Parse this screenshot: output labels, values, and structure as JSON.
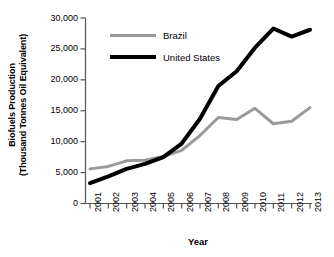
{
  "chart_data": {
    "type": "line",
    "title": "",
    "xlabel": "Year",
    "ylabel": "Biofuels Production (Thousand Tonnes Oil Equivalent)",
    "ylabel_line1": "Biofuels Production",
    "ylabel_line2": "(Thousand Tonnes Oil Equivalent)",
    "categories": [
      "2001",
      "2002",
      "2003",
      "2004",
      "2005",
      "2006",
      "2007",
      "2008",
      "2009",
      "2010",
      "2011",
      "2012",
      "2013"
    ],
    "x": [
      2001,
      2002,
      2003,
      2004,
      2005,
      2006,
      2007,
      2008,
      2009,
      2010,
      2011,
      2012,
      2013
    ],
    "xtick_labels": [
      "2001",
      "2002",
      "2003",
      "2004",
      "2005",
      "2006",
      "2007",
      "2008",
      "2009",
      "2010",
      "2011",
      "2012",
      "2013"
    ],
    "ytick_labels": [
      "0",
      "5,000",
      "10,000",
      "15,000",
      "20,000",
      "25,000",
      "30,000"
    ],
    "ytick_values": [
      0,
      5000,
      10000,
      15000,
      20000,
      25000,
      30000
    ],
    "ylim": [
      0,
      30000
    ],
    "xlim": [
      2001,
      2013
    ],
    "grid": false,
    "legend_position": "upper-left-inside",
    "series": [
      {
        "name": "Brazil",
        "color": "#9a9a9a",
        "line_width": 3,
        "values": [
          5600,
          6000,
          6900,
          7000,
          7600,
          8600,
          11000,
          13900,
          13600,
          15400,
          12900,
          13300,
          15500
        ]
      },
      {
        "name": "United States",
        "color": "#000000",
        "line_width": 4,
        "values": [
          3300,
          4400,
          5600,
          6400,
          7500,
          9700,
          13700,
          19000,
          21400,
          25200,
          28300,
          27000,
          28100
        ]
      }
    ]
  },
  "legend": {
    "items": [
      {
        "label": "Brazil",
        "color": "#9a9a9a"
      },
      {
        "label": "United States",
        "color": "#000000"
      }
    ]
  },
  "axes": {
    "x_title": "Year",
    "y_title_line1": "Biofuels Production",
    "y_title_line2": "(Thousand Tonnes Oil Equivalent)"
  },
  "colors": {
    "brazil": "#9a9a9a",
    "united_states": "#000000",
    "axis": "#555555",
    "background": "#ffffff"
  }
}
